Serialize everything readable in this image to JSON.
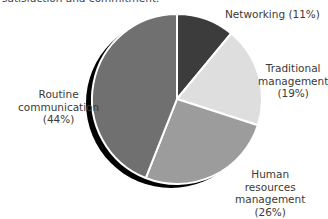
{
  "caption_fragment": "satisfaction and commitment.",
  "chart_data": {
    "type": "pie",
    "title": "",
    "start_angle_deg": 0,
    "direction": "clockwise",
    "slices": [
      {
        "label": "Networking",
        "value": 11,
        "display": "Networking (11%)",
        "color": "#3c3c3c"
      },
      {
        "label": "Traditional management",
        "value": 19,
        "display": "(19%)",
        "color": "#dedede"
      },
      {
        "label": "Human resources management",
        "value": 26,
        "display": "(26%)",
        "color": "#9c9c9c"
      },
      {
        "label": "Routine communication",
        "value": 44,
        "display": "(44%)",
        "color": "#707070"
      }
    ],
    "shadow": true,
    "legend": "none (direct labels)"
  },
  "labels": {
    "networking": "Networking (11%)",
    "traditional_line1": "Traditional",
    "traditional_line2": "management",
    "traditional_pct": "(19%)",
    "hr_line1": "Human",
    "hr_line2": "resources",
    "hr_line3": "management",
    "hr_pct": "(26%)",
    "routine_line1": "Routine",
    "routine_line2": "communication",
    "routine_pct": "(44%)"
  }
}
